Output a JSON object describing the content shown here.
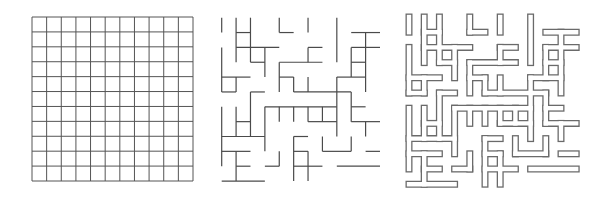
{
  "figure": {
    "colors": {
      "background": "#ffffff",
      "line": "#4a4a4a",
      "grid_line": "#555555"
    }
  },
  "panels": [
    {
      "id": "grid",
      "label": "Full grid",
      "cols": 11,
      "rows": 11,
      "box": {
        "x": 32,
        "y": 17,
        "w": 161,
        "h": 164
      }
    },
    {
      "id": "maze-walls",
      "label": "Maze walls (thin lines)",
      "box": {
        "x": 221.7,
        "y": 17.7,
        "cell_w": 14.39,
        "cell_h": 14.85
      },
      "vertical": [
        [
          0,
          0,
          1
        ],
        [
          0,
          2,
          5
        ],
        [
          0,
          6,
          10
        ],
        [
          1,
          0,
          3
        ],
        [
          1,
          4,
          5
        ],
        [
          1,
          6,
          8
        ],
        [
          1,
          9,
          11
        ],
        [
          2,
          0,
          3
        ],
        [
          2,
          5,
          8
        ],
        [
          3,
          2,
          4
        ],
        [
          3,
          6,
          9
        ],
        [
          4,
          0,
          1
        ],
        [
          4,
          3,
          5
        ],
        [
          4,
          6,
          7
        ],
        [
          4,
          9,
          10
        ],
        [
          5,
          4,
          5
        ],
        [
          5,
          6,
          7
        ],
        [
          5,
          8,
          11
        ],
        [
          6,
          0,
          1
        ],
        [
          6,
          2,
          3
        ],
        [
          6,
          4,
          5
        ],
        [
          6,
          6,
          7
        ],
        [
          6,
          9,
          11
        ],
        [
          7,
          6,
          7
        ],
        [
          7,
          8,
          9
        ],
        [
          8,
          0,
          3
        ],
        [
          8,
          4,
          8
        ],
        [
          9,
          2,
          4
        ],
        [
          9,
          5,
          7
        ],
        [
          9,
          8,
          9
        ],
        [
          10,
          1,
          5
        ],
        [
          10,
          7,
          8
        ]
      ],
      "horizontal": [
        [
          1,
          1,
          2
        ],
        [
          1,
          4,
          5
        ],
        [
          1,
          9,
          11
        ],
        [
          2,
          1,
          4
        ],
        [
          2,
          6,
          7
        ],
        [
          2,
          9,
          11
        ],
        [
          3,
          2,
          3
        ],
        [
          3,
          4,
          7
        ],
        [
          3,
          9,
          10
        ],
        [
          4,
          0,
          2
        ],
        [
          4,
          4,
          5
        ],
        [
          4,
          8,
          10
        ],
        [
          5,
          0,
          1
        ],
        [
          5,
          2,
          3
        ],
        [
          5,
          5,
          9
        ],
        [
          6,
          3,
          8
        ],
        [
          6,
          9,
          10
        ],
        [
          7,
          1,
          2
        ],
        [
          7,
          6,
          8
        ],
        [
          7,
          9,
          11
        ],
        [
          8,
          0,
          3
        ],
        [
          8,
          5,
          6
        ],
        [
          9,
          0,
          2
        ],
        [
          9,
          5,
          6
        ],
        [
          9,
          7,
          9
        ],
        [
          9,
          10,
          11
        ],
        [
          10,
          1,
          2
        ],
        [
          10,
          3,
          4
        ],
        [
          10,
          5,
          7
        ],
        [
          10,
          8,
          11
        ],
        [
          11,
          0,
          3
        ]
      ]
    },
    {
      "id": "maze-outlined",
      "label": "Maze walls (outlined)",
      "box": {
        "x": 409,
        "y": 17,
        "cell_w": 15.2,
        "cell_h": 15.2
      },
      "outer_width": 7,
      "inner_width": 4.4
    }
  ]
}
